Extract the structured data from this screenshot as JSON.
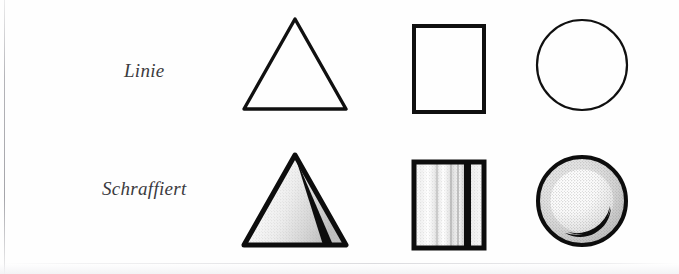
{
  "figure": {
    "background_color": "#fefefe",
    "ink_color": "#101010",
    "label_color": "#3b3b3e",
    "rows": [
      {
        "id": "linie",
        "label": "Linie",
        "style_name": "outline",
        "shapes": [
          {
            "name": "triangle",
            "fill": "none",
            "stroke": "#101010",
            "stroke_width": 3
          },
          {
            "name": "rectangle",
            "fill": "none",
            "stroke": "#101010",
            "stroke_width": 4
          },
          {
            "name": "circle",
            "fill": "none",
            "stroke": "#101010",
            "stroke_width": 2
          }
        ]
      },
      {
        "id": "schraffiert",
        "label": "Schraffiert",
        "style_name": "hatched",
        "shapes": [
          {
            "name": "triangle",
            "fill": "hatched-gradient",
            "accent": "diagonal-band",
            "stroke": "#101010",
            "stroke_width": 5
          },
          {
            "name": "rectangle",
            "fill": "vertical-stripes",
            "accent": "black-bar",
            "stroke": "#101010",
            "stroke_width": 5
          },
          {
            "name": "circle",
            "fill": "stipple-halftone",
            "accent": "crescent-moon",
            "stroke": "#101010",
            "stroke_width": 4
          }
        ]
      }
    ]
  }
}
